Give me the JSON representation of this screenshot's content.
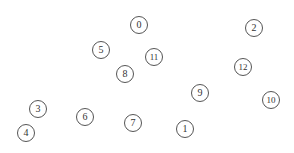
{
  "diagram": {
    "type": "node-layout",
    "width": 294,
    "height": 153,
    "node_radius": 9,
    "colors": {
      "background": "#ffffff",
      "node_stroke": "#555555",
      "node_fill": "#ffffff",
      "label": "#333333"
    },
    "nodes": [
      {
        "label": "0",
        "x": 139,
        "y": 25
      },
      {
        "label": "1",
        "x": 185,
        "y": 129
      },
      {
        "label": "2",
        "x": 254,
        "y": 28
      },
      {
        "label": "3",
        "x": 38,
        "y": 109
      },
      {
        "label": "4",
        "x": 26,
        "y": 133
      },
      {
        "label": "5",
        "x": 101,
        "y": 50
      },
      {
        "label": "6",
        "x": 85,
        "y": 117
      },
      {
        "label": "7",
        "x": 133,
        "y": 123
      },
      {
        "label": "8",
        "x": 125,
        "y": 74
      },
      {
        "label": "9",
        "x": 200,
        "y": 93
      },
      {
        "label": "10",
        "x": 271,
        "y": 100
      },
      {
        "label": "11",
        "x": 154,
        "y": 57
      },
      {
        "label": "12",
        "x": 243,
        "y": 67
      }
    ],
    "edges": []
  }
}
